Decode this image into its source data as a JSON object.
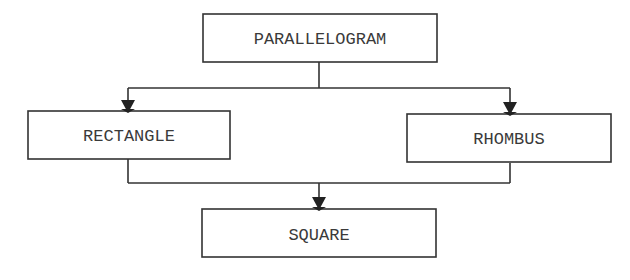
{
  "diagram": {
    "type": "hierarchy",
    "stroke_color": "#333333",
    "text_color": "#3a3a3a",
    "background": "#ffffff",
    "nodes": {
      "parallelogram": {
        "label": "PARALLELOGRAM"
      },
      "rectangle": {
        "label": "RECTANGLE"
      },
      "rhombus": {
        "label": "RHOMBUS"
      },
      "square": {
        "label": "SQUARE"
      }
    },
    "edges": [
      {
        "from": "PARALLELOGRAM",
        "to": "RECTANGLE"
      },
      {
        "from": "PARALLELOGRAM",
        "to": "RHOMBUS"
      },
      {
        "from": "RECTANGLE",
        "to": "SQUARE"
      },
      {
        "from": "RHOMBUS",
        "to": "SQUARE"
      }
    ]
  }
}
